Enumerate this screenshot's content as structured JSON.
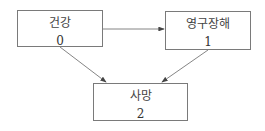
{
  "diagram": {
    "type": "state-transition",
    "nodes": [
      {
        "id": "0",
        "label": "건강",
        "number": "0"
      },
      {
        "id": "1",
        "label": "영구장해",
        "number": "1"
      },
      {
        "id": "2",
        "label": "사망",
        "number": "2"
      }
    ],
    "edges": [
      {
        "from": "0",
        "to": "1"
      },
      {
        "from": "0",
        "to": "2"
      },
      {
        "from": "1",
        "to": "2"
      }
    ],
    "colors": {
      "border": "#7a7a7a",
      "arrow": "#555555",
      "text": "#333333"
    }
  }
}
